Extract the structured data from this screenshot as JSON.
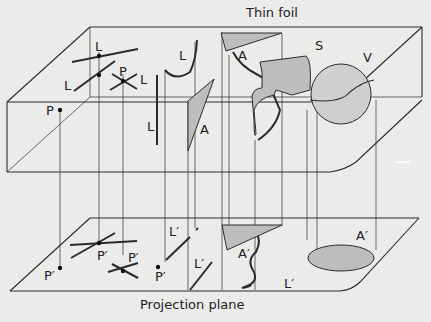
{
  "diagram": {
    "top_title": "Thin foil",
    "bottom_title": "Projection plane",
    "colors": {
      "background": "#ebebea",
      "line": "#2b2b2b",
      "shade": "#b8b8b6"
    },
    "labels": {
      "L1": "L",
      "L2": "L",
      "P1": "P",
      "L3": "L",
      "L4": "L",
      "L5": "L",
      "A1": "A",
      "A2": "A",
      "S": "S",
      "V": "V",
      "P_side": "P",
      "Pp1": "P′",
      "Pp2": "P′",
      "Pp3": "P′",
      "Pp4": "P′",
      "Lp1": "L′",
      "Lp2": "L′",
      "Lp3": "L′",
      "Ap1": "A′",
      "Ap2": "A′"
    }
  }
}
